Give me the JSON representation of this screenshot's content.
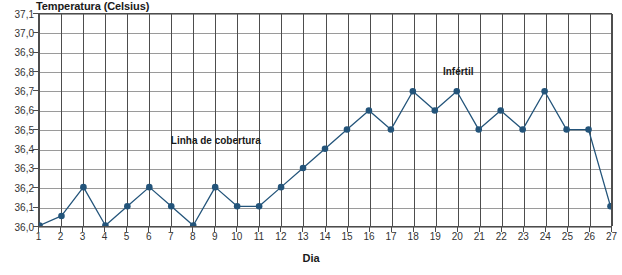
{
  "chart_data": {
    "type": "line",
    "title": "",
    "ylabel": "Temperatura (Celsius)",
    "xlabel": "Dia",
    "grid": true,
    "legend": "none",
    "xlim": [
      1,
      27
    ],
    "ylim": [
      36.0,
      37.1
    ],
    "ytick_labels": [
      "37,1",
      "37,0",
      "36,9",
      "36,8",
      "36,7",
      "36,6",
      "36,5",
      "36,4",
      "36,3",
      "36,2",
      "36,1",
      "36,0"
    ],
    "ytick_values": [
      37.1,
      37.0,
      36.9,
      36.8,
      36.7,
      36.6,
      36.5,
      36.4,
      36.3,
      36.2,
      36.1,
      36.0
    ],
    "categories": [
      "1",
      "2",
      "3",
      "4",
      "5",
      "6",
      "7",
      "8",
      "9",
      "10",
      "11",
      "12",
      "13",
      "14",
      "15",
      "16",
      "17",
      "18",
      "19",
      "20",
      "21",
      "22",
      "23",
      "24",
      "25",
      "26",
      "27"
    ],
    "x": [
      1,
      2,
      3,
      4,
      5,
      6,
      7,
      8,
      9,
      10,
      11,
      12,
      13,
      14,
      15,
      16,
      17,
      18,
      19,
      20,
      21,
      22,
      23,
      24,
      25,
      26,
      27
    ],
    "values": [
      36.0,
      36.05,
      36.2,
      36.0,
      36.1,
      36.2,
      36.1,
      36.0,
      36.2,
      36.1,
      36.1,
      36.2,
      36.3,
      36.4,
      36.5,
      36.6,
      36.5,
      36.7,
      36.6,
      36.7,
      36.5,
      36.6,
      36.5,
      36.7,
      36.5,
      36.5,
      36.1
    ],
    "series": [
      {
        "name": "Temperatura basal",
        "values": [
          36.0,
          36.05,
          36.2,
          36.0,
          36.1,
          36.2,
          36.1,
          36.0,
          36.2,
          36.1,
          36.1,
          36.2,
          36.3,
          36.4,
          36.5,
          36.6,
          36.5,
          36.7,
          36.6,
          36.7,
          36.5,
          36.6,
          36.5,
          36.7,
          36.5,
          36.5,
          36.1
        ],
        "color": "#23547a",
        "marker": "circle"
      }
    ],
    "annotations": [
      {
        "text": "Linha de cobertura",
        "x": 9.0,
        "y": 36.45
      },
      {
        "text": "Infértil",
        "x": 20.0,
        "y": 36.81
      }
    ],
    "colors": {
      "series": "#23547a",
      "grid_horizontal": "#9a9a9a",
      "grid_vertical": "#4d4d4d",
      "axis": "#4d4d4d",
      "text": "#1a1a1a",
      "tick_text": "#333333",
      "background": "#ffffff"
    }
  }
}
